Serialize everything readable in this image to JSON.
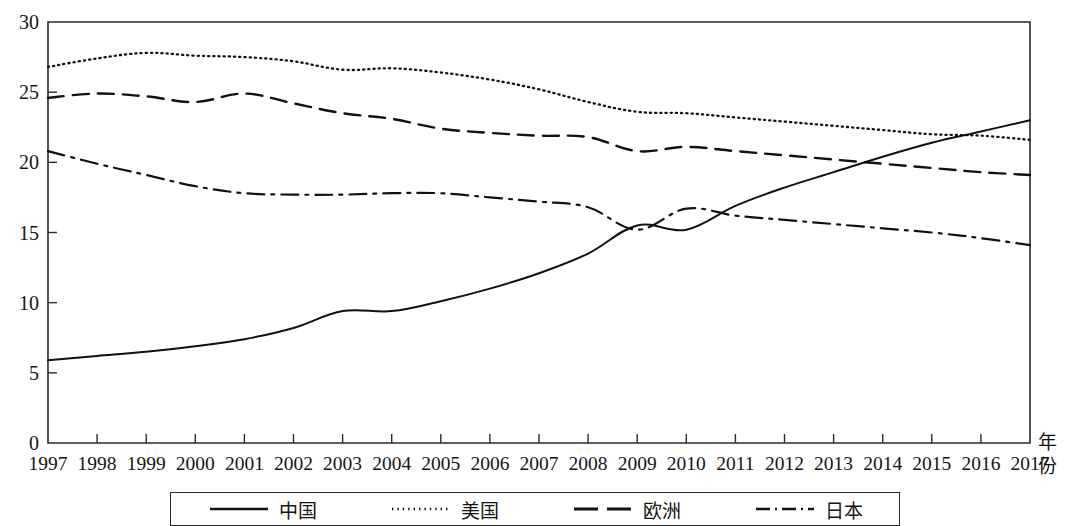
{
  "chart_data": {
    "type": "line",
    "title": "",
    "xlabel": "年份",
    "ylabel": "",
    "x": [
      1997,
      1998,
      1999,
      2000,
      2001,
      2002,
      2003,
      2004,
      2005,
      2006,
      2007,
      2008,
      2009,
      2010,
      2011,
      2012,
      2013,
      2014,
      2015,
      2016,
      2017
    ],
    "xlim": [
      1997,
      2017
    ],
    "ylim": [
      0,
      30
    ],
    "yticks": [
      0,
      5,
      10,
      15,
      20,
      25,
      30
    ],
    "xticks": [
      "1997",
      "1998",
      "1999",
      "2000",
      "2001",
      "2002",
      "2003",
      "2004",
      "2005",
      "2006",
      "2007",
      "2008",
      "2009",
      "2010",
      "2011",
      "2012",
      "2013",
      "2014",
      "2015",
      "2016",
      "2017"
    ],
    "grid": false,
    "legend_position": "bottom",
    "series": [
      {
        "name": "中国",
        "style": "solid",
        "values": [
          5.9,
          6.2,
          6.5,
          6.9,
          7.4,
          8.2,
          9.4,
          9.4,
          10.1,
          11.0,
          12.1,
          13.5,
          15.5,
          15.2,
          16.9,
          18.2,
          19.3,
          20.4,
          21.4,
          22.2,
          23.0
        ]
      },
      {
        "name": "美国",
        "style": "dotted",
        "values": [
          26.8,
          27.4,
          27.8,
          27.6,
          27.5,
          27.2,
          26.6,
          26.7,
          26.4,
          25.9,
          25.2,
          24.3,
          23.6,
          23.5,
          23.2,
          22.9,
          22.6,
          22.3,
          22.0,
          21.9,
          21.6
        ]
      },
      {
        "name": "欧洲",
        "style": "dashed",
        "values": [
          24.6,
          24.9,
          24.7,
          24.3,
          24.9,
          24.2,
          23.5,
          23.1,
          22.4,
          22.1,
          21.9,
          21.8,
          20.8,
          21.1,
          20.8,
          20.5,
          20.2,
          19.9,
          19.6,
          19.3,
          19.1
        ]
      },
      {
        "name": "日本",
        "style": "dash-dot",
        "values": [
          20.8,
          19.9,
          19.1,
          18.3,
          17.8,
          17.7,
          17.7,
          17.8,
          17.8,
          17.5,
          17.2,
          16.8,
          15.2,
          16.7,
          16.2,
          15.9,
          15.6,
          15.3,
          15.0,
          14.6,
          14.1
        ]
      }
    ]
  },
  "legend": {
    "items": [
      {
        "label": "中国",
        "style": "solid"
      },
      {
        "label": "美国",
        "style": "dotted"
      },
      {
        "label": "欧洲",
        "style": "dashed"
      },
      {
        "label": "日本",
        "style": "dash-dot"
      }
    ]
  },
  "axis": {
    "x_title_line1": "年",
    "x_title_line2": "份"
  },
  "colors": {
    "line": "#111111",
    "axis": "#2b2b2b",
    "background": "#ffffff"
  }
}
